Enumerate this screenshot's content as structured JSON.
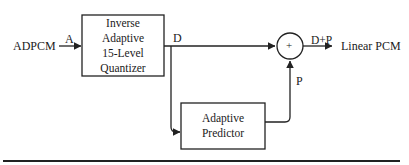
{
  "diagram": {
    "input_label": "ADPCM",
    "output_label": "Linear PCM",
    "blocks": [
      {
        "id": "quantizer",
        "lines": [
          "Inverse",
          "Adaptive",
          "15-Level",
          "Quantizer"
        ]
      },
      {
        "id": "predictor",
        "lines": [
          "Adaptive",
          "Predictor"
        ]
      }
    ],
    "summer": {
      "symbol": "+"
    },
    "signals": {
      "a": "A",
      "d": "D",
      "p": "P",
      "sum": "D+P"
    }
  }
}
